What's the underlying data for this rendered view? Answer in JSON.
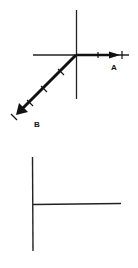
{
  "figure_top": {
    "description": "Coordinate axes with two vectors from origin",
    "vectors": [
      {
        "label": "A",
        "direction": "right",
        "tick_marks": 2
      },
      {
        "label": "B",
        "direction": "down-left",
        "tick_marks": 4
      }
    ]
  },
  "figure_bottom": {
    "description": "Vertical line with horizontal line extending right from its midpoint"
  },
  "colors": {
    "line": "#111111",
    "background": "#ffffff"
  }
}
